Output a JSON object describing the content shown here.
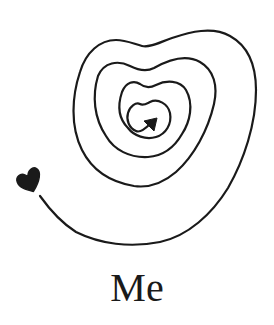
{
  "illustration": {
    "description": "Hand-drawn heart-shaped spiral line ending in a small filled heart",
    "stroke_color": "#1a1a1a",
    "background_color": "#ffffff",
    "spiral_turns": 4,
    "tail_icon": "heart-icon",
    "center_icon": "arrowhead-icon"
  },
  "caption": {
    "text": "Me"
  }
}
